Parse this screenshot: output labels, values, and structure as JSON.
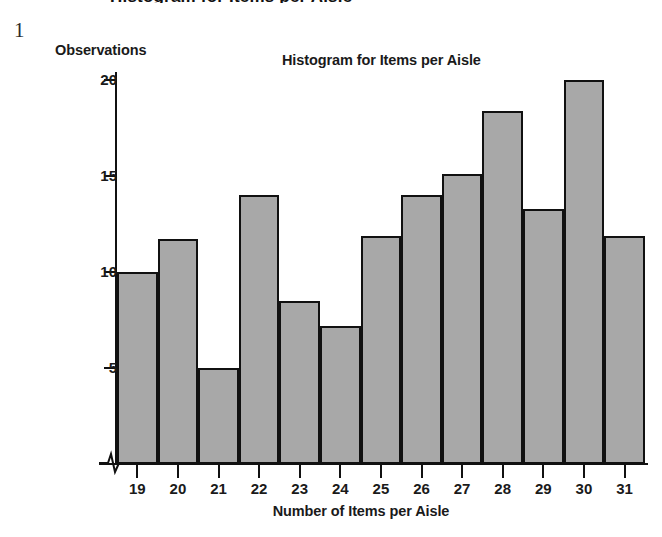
{
  "page": {
    "page_number": "1",
    "cut_off_header": "Histogram for Items per Aisle"
  },
  "chart_data": {
    "type": "bar",
    "title": "Histogram for Items per Aisle",
    "xlabel": "Number of Items per Aisle",
    "ylabel": "Observations",
    "categories": [
      "19",
      "20",
      "21",
      "22",
      "23",
      "24",
      "25",
      "26",
      "27",
      "28",
      "29",
      "30",
      "31"
    ],
    "values": [
      10,
      11.7,
      5,
      14,
      8.5,
      7.2,
      11.9,
      14,
      15.1,
      18.4,
      13.3,
      20,
      11.9
    ],
    "ytick_labels": [
      "5",
      "10",
      "15",
      "20"
    ],
    "ytick_values": [
      5,
      10,
      15,
      20
    ],
    "ylim": [
      0,
      20
    ],
    "y_axis_break": true,
    "grid": false,
    "legend": "none",
    "bar_fill_color": "#a8a8a8",
    "bar_edge_color": "#111111"
  }
}
